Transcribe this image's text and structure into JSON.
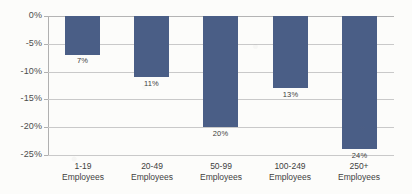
{
  "chart_data": {
    "type": "bar",
    "title": "",
    "subtitle": "",
    "xlabel": "",
    "ylabel": "",
    "orientation": "vertical",
    "grid": true,
    "legend": false,
    "legend_position": "none",
    "ylim": [
      -25,
      0
    ],
    "ytick_labels": [
      "0%",
      "-5%",
      "-10%",
      "-15%",
      "-20%",
      "-25%"
    ],
    "ytick_values": [
      0,
      -5,
      -10,
      -15,
      -20,
      -25
    ],
    "categories": [
      "1-19 Employees",
      "20-49 Employees",
      "50-99 Employees",
      "100-249 Employees",
      "250+ Employees"
    ],
    "category_lines": [
      [
        "1-19",
        "Employees"
      ],
      [
        "20-49",
        "Employees"
      ],
      [
        "50-99",
        "Employees"
      ],
      [
        "100-249",
        "Employees"
      ],
      [
        "250+",
        "Employees"
      ]
    ],
    "values": [
      -7,
      -11,
      -20,
      -13,
      -24
    ],
    "data_labels": [
      "7%",
      "11%",
      "20%",
      "13%",
      "24%"
    ],
    "bar_color": "#4a5e86",
    "grid_color": "#c9c9c9",
    "axis_color": "#b0b0b0",
    "background_color": "#fcfcfa"
  }
}
